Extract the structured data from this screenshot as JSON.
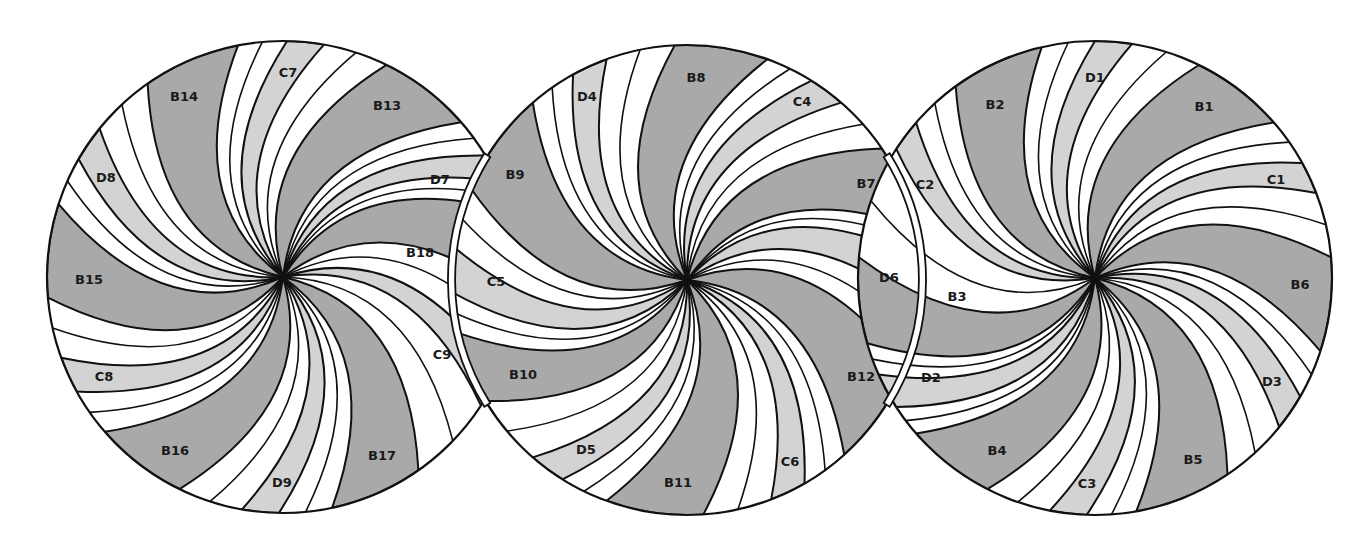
{
  "diagram": {
    "colors": {
      "background": "#ffffff",
      "dark": "#a9a9a9",
      "light": "#d3d3d3",
      "white": "#ffffff",
      "outline": "#111111"
    },
    "circles": [
      {
        "id": "left",
        "cx": 283,
        "cy": 277,
        "r": 236,
        "segments": [
          {
            "label": "C7",
            "tone": "light",
            "a1": -89,
            "a2": -80,
            "lx": 288,
            "ly": 73
          },
          {
            "label": "B13",
            "tone": "dark",
            "a1": -64,
            "a2": -41,
            "lx": 387,
            "ly": 106
          },
          {
            "label": "D7",
            "tone": "light",
            "a1": -31,
            "a2": -24,
            "lx": 440,
            "ly": 180
          },
          {
            "label": "B18",
            "tone": "dark",
            "a1": -16,
            "a2": 5,
            "lx": 420,
            "ly": 253
          },
          {
            "label": "C9",
            "tone": "light",
            "a1": 24,
            "a2": 33,
            "lx": 442,
            "ly": 355
          },
          {
            "label": "B17",
            "tone": "dark",
            "a1": 55,
            "a2": 78,
            "lx": 382,
            "ly": 456
          },
          {
            "label": "D9",
            "tone": "light",
            "a1": 91,
            "a2": 100,
            "lx": 282,
            "ly": 483
          },
          {
            "label": "B16",
            "tone": "dark",
            "a1": 116,
            "a2": 139,
            "lx": 175,
            "ly": 451
          },
          {
            "label": "C8",
            "tone": "light",
            "a1": 151,
            "a2": 160,
            "lx": 104,
            "ly": 377
          },
          {
            "label": "B15",
            "tone": "dark",
            "a1": 175,
            "a2": 198,
            "lx": 89,
            "ly": 280
          },
          {
            "label": "D8",
            "tone": "light",
            "a1": 210,
            "a2": 219,
            "lx": 106,
            "ly": 178
          },
          {
            "label": "B14",
            "tone": "dark",
            "a1": 235,
            "a2": 259,
            "lx": 184,
            "ly": 97
          }
        ]
      },
      {
        "id": "middle",
        "cx": 687,
        "cy": 280,
        "r": 235,
        "segments": [
          {
            "label": "B8",
            "tone": "dark",
            "a1": -93,
            "a2": -70,
            "lx": 696,
            "ly": 78
          },
          {
            "label": "C4",
            "tone": "light",
            "a1": -58,
            "a2": -49,
            "lx": 802,
            "ly": 102
          },
          {
            "label": "B7",
            "tone": "dark",
            "a1": -34,
            "a2": -13,
            "lx": 866,
            "ly": 184
          },
          {
            "label": "D6",
            "tone": "light",
            "a1": -5,
            "a2": 7,
            "lx": 889,
            "ly": 278
          },
          {
            "label": "B12",
            "tone": "dark",
            "a1": 22,
            "a2": 48,
            "lx": 861,
            "ly": 377
          },
          {
            "label": "C6",
            "tone": "light",
            "a1": 60,
            "a2": 69,
            "lx": 790,
            "ly": 462
          },
          {
            "label": "B11",
            "tone": "dark",
            "a1": 86,
            "a2": 110,
            "lx": 678,
            "ly": 483
          },
          {
            "label": "D5",
            "tone": "light",
            "a1": 122,
            "a2": 131,
            "lx": 586,
            "ly": 450
          },
          {
            "label": "B10",
            "tone": "dark",
            "a1": 149,
            "a2": 167,
            "lx": 523,
            "ly": 375
          },
          {
            "label": "C5",
            "tone": "light",
            "a1": 177,
            "a2": 188,
            "lx": 496,
            "ly": 282
          },
          {
            "label": "B9",
            "tone": "dark",
            "a1": 203,
            "a2": 229,
            "lx": 515,
            "ly": 175
          },
          {
            "label": "D4",
            "tone": "light",
            "a1": 241,
            "a2": 250,
            "lx": 587,
            "ly": 97
          }
        ]
      },
      {
        "id": "right",
        "cx": 1095,
        "cy": 278,
        "r": 237,
        "segments": [
          {
            "label": "D1",
            "tone": "light",
            "a1": -90,
            "a2": -81,
            "lx": 1095,
            "ly": 78
          },
          {
            "label": "B1",
            "tone": "dark",
            "a1": -64,
            "a2": -41,
            "lx": 1204,
            "ly": 107
          },
          {
            "label": "C1",
            "tone": "light",
            "a1": -29,
            "a2": -21,
            "lx": 1276,
            "ly": 180
          },
          {
            "label": "B6",
            "tone": "dark",
            "a1": -5,
            "a2": 18,
            "lx": 1300,
            "ly": 285
          },
          {
            "label": "D3",
            "tone": "light",
            "a1": 30,
            "a2": 39,
            "lx": 1272,
            "ly": 382
          },
          {
            "label": "B5",
            "tone": "dark",
            "a1": 56,
            "a2": 80,
            "lx": 1193,
            "ly": 460
          },
          {
            "label": "C3",
            "tone": "light",
            "a1": 92,
            "a2": 101,
            "lx": 1087,
            "ly": 484
          },
          {
            "label": "B4",
            "tone": "dark",
            "a1": 117,
            "a2": 139,
            "lx": 997,
            "ly": 451
          },
          {
            "label": "D2",
            "tone": "light",
            "a1": 147,
            "a2": 156,
            "lx": 931,
            "ly": 378
          },
          {
            "label": "B3",
            "tone": "dark",
            "a1": 164,
            "a2": 185,
            "lx": 957,
            "ly": 297
          },
          {
            "label": "C2",
            "tone": "light",
            "a1": 213,
            "a2": 221,
            "lx": 925,
            "ly": 185
          },
          {
            "label": "B2",
            "tone": "dark",
            "a1": 234,
            "a2": 257,
            "lx": 995,
            "ly": 105
          }
        ]
      }
    ],
    "connectors": [
      {
        "id": "left-connector",
        "side": "left"
      },
      {
        "id": "right-connector",
        "side": "right"
      }
    ]
  }
}
